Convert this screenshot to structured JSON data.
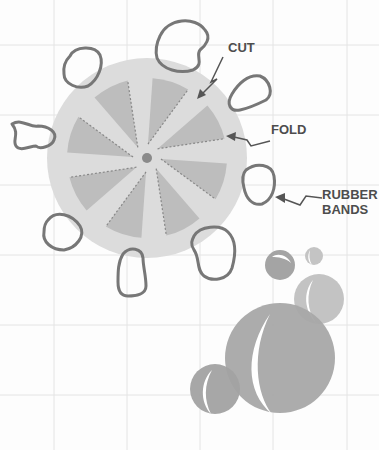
{
  "diagram": {
    "labels": {
      "cut": "CUT",
      "fold": "FOLD",
      "rubber_bands_line1": "RUBBER",
      "rubber_bands_line2": "BANDS"
    },
    "colors": {
      "background": "#fdfdfd",
      "grid": "#e4e4e4",
      "disc": "#dcdcdc",
      "wedge": "#bdbdbd",
      "outline": "#757575",
      "center_dot": "#8a8a8a",
      "marble_dark": "#a2a2a2",
      "marble_light": "#bdbdbd",
      "highlight": "#ffffff"
    }
  }
}
